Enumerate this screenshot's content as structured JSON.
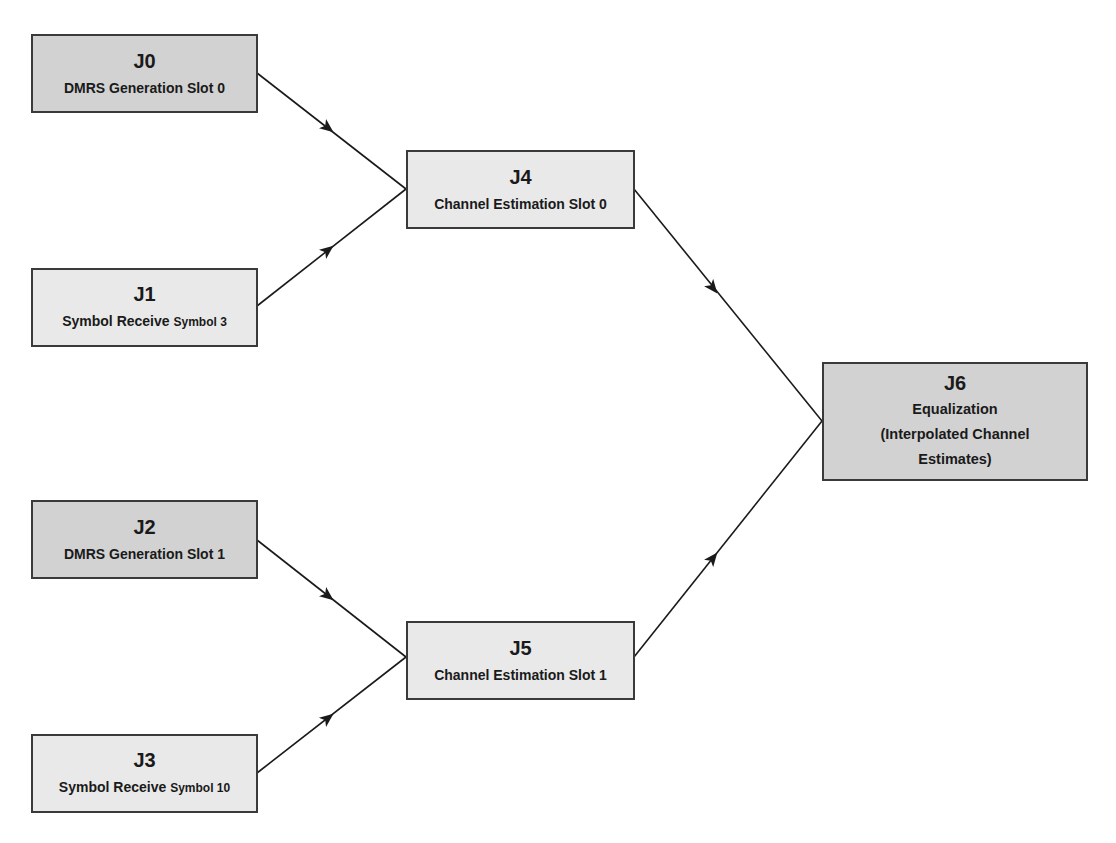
{
  "diagram": {
    "type": "job dependency graph",
    "nodes": [
      {
        "id": "J0",
        "label": "DMRS Generation Slot 0",
        "label_main": "DMRS Generation Slot 0",
        "label_small": "",
        "shade": "dark"
      },
      {
        "id": "J1",
        "label": "Symbol Receive Symbol 3",
        "label_main": "Symbol Receive ",
        "label_small": "Symbol 3",
        "shade": "light"
      },
      {
        "id": "J2",
        "label": "DMRS Generation Slot 1",
        "label_main": "DMRS Generation Slot 1",
        "label_small": "",
        "shade": "dark"
      },
      {
        "id": "J3",
        "label": "Symbol Receive Symbol 10",
        "label_main": "Symbol Receive ",
        "label_small": "Symbol 10",
        "shade": "light"
      },
      {
        "id": "J4",
        "label": "Channel Estimation Slot 0",
        "label_main": "Channel Estimation Slot 0",
        "label_small": "",
        "shade": "light"
      },
      {
        "id": "J5",
        "label": "Channel Estimation Slot 1",
        "label_main": "Channel Estimation Slot 1",
        "label_small": "",
        "shade": "light"
      },
      {
        "id": "J6",
        "label": "Equalization (Interpolated Channel Estimates)",
        "label_lines": [
          "Equalization",
          "(Interpolated Channel",
          "Estimates)"
        ],
        "shade": "dark"
      }
    ],
    "edges": [
      {
        "from": "J0",
        "to": "J4"
      },
      {
        "from": "J1",
        "to": "J4"
      },
      {
        "from": "J2",
        "to": "J5"
      },
      {
        "from": "J3",
        "to": "J5"
      },
      {
        "from": "J4",
        "to": "J6"
      },
      {
        "from": "J5",
        "to": "J6"
      }
    ],
    "colors": {
      "node_dark": "#d2d2d2",
      "node_light": "#e9e9e9",
      "border": "#3a3a3a",
      "edge": "#1a1a1a",
      "background": "#ffffff"
    }
  }
}
